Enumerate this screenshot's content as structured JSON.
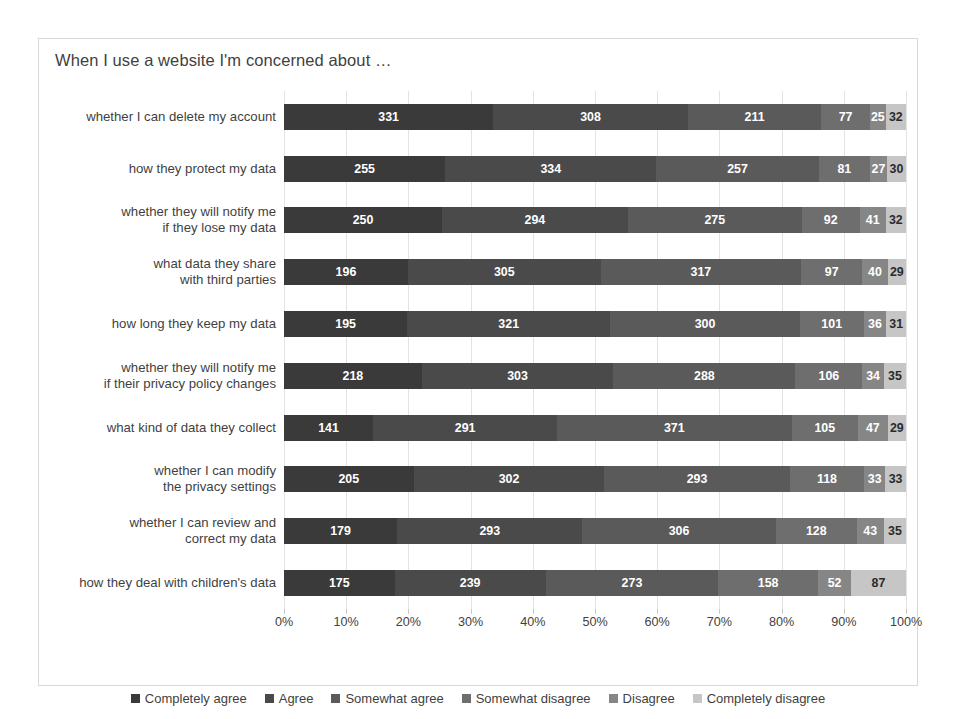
{
  "chart_data": {
    "type": "bar",
    "subtype": "stacked-horizontal-100-percent",
    "title": "When I use a website I'm concerned about …",
    "xlabel": "",
    "ylabel": "",
    "xlim": [
      0,
      100
    ],
    "grid": true,
    "legend_position": "bottom",
    "xtick_labels": [
      "0%",
      "10%",
      "20%",
      "30%",
      "40%",
      "50%",
      "60%",
      "70%",
      "80%",
      "90%",
      "100%"
    ],
    "xtick_values": [
      0,
      10,
      20,
      30,
      40,
      50,
      60,
      70,
      80,
      90,
      100
    ],
    "categories": [
      "whether I can delete my account",
      "how they protect my data",
      "whether they will notify me\nif they lose my data",
      "what data they share\nwith third parties",
      "how long they keep my data",
      "whether they will notify me\nif their privacy policy changes",
      "what kind of data they collect",
      "whether I can modify\nthe privacy settings",
      "whether I can review and\ncorrect my data",
      "how they deal with children's data"
    ],
    "series": [
      {
        "name": "Completely agree",
        "color": "#3a3a3a",
        "values": [
          331,
          255,
          250,
          196,
          195,
          218,
          141,
          205,
          179,
          175
        ]
      },
      {
        "name": "Agree",
        "color": "#4a4a4a",
        "values": [
          308,
          334,
          294,
          305,
          321,
          303,
          291,
          302,
          293,
          239
        ]
      },
      {
        "name": "Somewhat agree",
        "color": "#5a5a5a",
        "values": [
          211,
          257,
          275,
          317,
          300,
          288,
          371,
          293,
          306,
          273
        ]
      },
      {
        "name": "Somewhat disagree",
        "color": "#6e6e6e",
        "values": [
          77,
          81,
          92,
          97,
          101,
          106,
          105,
          118,
          128,
          158
        ]
      },
      {
        "name": "Disagree",
        "color": "#868686",
        "values": [
          25,
          27,
          41,
          40,
          36,
          34,
          47,
          33,
          43,
          52
        ]
      },
      {
        "name": "Completely disagree",
        "color": "#c6c6c6",
        "values": [
          32,
          30,
          32,
          29,
          31,
          35,
          29,
          33,
          35,
          87
        ]
      }
    ]
  }
}
